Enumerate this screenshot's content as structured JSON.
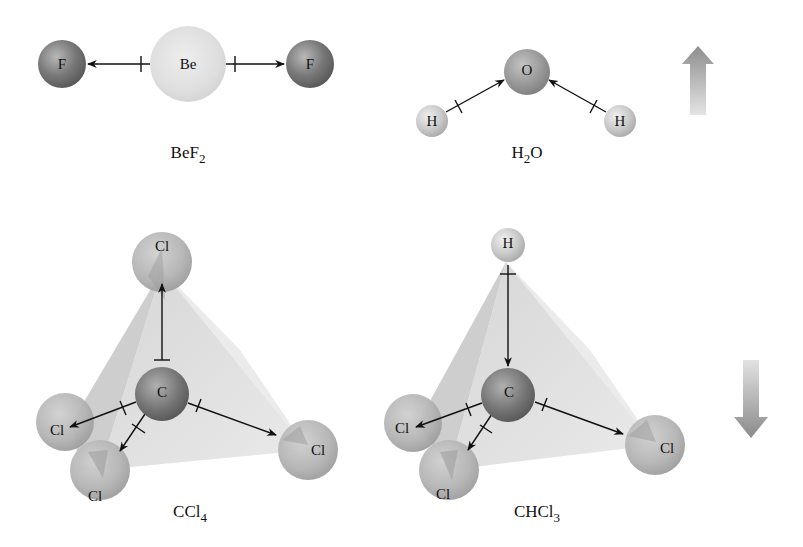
{
  "figure": {
    "molecules": [
      {
        "id": "BeF2",
        "label": {
          "base": "BeF",
          "subscript": "2"
        },
        "geometry": "linear",
        "atoms": [
          {
            "symbol": "F",
            "role": "terminal-left"
          },
          {
            "symbol": "Be",
            "role": "central"
          },
          {
            "symbol": "F",
            "role": "terminal-right"
          }
        ]
      },
      {
        "id": "H2O",
        "label": {
          "pre": "H",
          "subscript": "2",
          "post": "O"
        },
        "geometry": "bent",
        "atoms": [
          {
            "symbol": "O",
            "role": "central"
          },
          {
            "symbol": "H",
            "role": "terminal-left"
          },
          {
            "symbol": "H",
            "role": "terminal-right"
          }
        ]
      },
      {
        "id": "CCl4",
        "label": {
          "base": "CCl",
          "subscript": "4"
        },
        "geometry": "tetrahedral",
        "atoms": [
          {
            "symbol": "Cl",
            "role": "top"
          },
          {
            "symbol": "C",
            "role": "central"
          },
          {
            "symbol": "Cl",
            "role": "left"
          },
          {
            "symbol": "Cl",
            "role": "bottom-left"
          },
          {
            "symbol": "Cl",
            "role": "right"
          }
        ]
      },
      {
        "id": "CHCl3",
        "label": {
          "base": "CHCl",
          "subscript": "3"
        },
        "geometry": "tetrahedral",
        "atoms": [
          {
            "symbol": "H",
            "role": "top"
          },
          {
            "symbol": "C",
            "role": "central"
          },
          {
            "symbol": "Cl",
            "role": "left"
          },
          {
            "symbol": "Cl",
            "role": "bottom-left"
          },
          {
            "symbol": "Cl",
            "role": "right"
          }
        ]
      }
    ],
    "net_dipole_arrows": [
      {
        "name": "up-arrow-icon",
        "direction": "up",
        "beside": "H2O"
      },
      {
        "name": "down-arrow-icon",
        "direction": "down",
        "beside": "CHCl3"
      }
    ],
    "colors": {
      "dark_atom": "#6e6e6e",
      "light_atom": "#dcdcdc",
      "mid_atom": "#a5a5a5",
      "tetrahedron_face": "#d4d4d4",
      "arrow_gradient_dark": "#8c8c8c",
      "arrow_gradient_light": "#e2e2e2",
      "bond_line": "#111111"
    }
  }
}
